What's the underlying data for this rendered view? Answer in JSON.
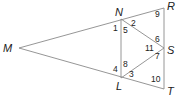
{
  "figure": {
    "colors": {
      "line": "#8a8a8a",
      "text": "#222222",
      "background": "#ffffff"
    },
    "vertices": [
      {
        "name": "M",
        "label": "M",
        "x": 19,
        "y": 48,
        "lx": 3,
        "ly": 52
      },
      {
        "name": "N",
        "label": "N",
        "x": 121,
        "y": 19,
        "lx": 115,
        "ly": 16
      },
      {
        "name": "R",
        "label": "R",
        "x": 164,
        "y": 8,
        "lx": 167,
        "ly": 10
      },
      {
        "name": "S",
        "label": "S",
        "x": 164,
        "y": 48,
        "lx": 167,
        "ly": 54
      },
      {
        "name": "L",
        "label": "L",
        "x": 121,
        "y": 78,
        "lx": 116,
        "ly": 90
      },
      {
        "name": "T",
        "label": "T",
        "x": 164,
        "y": 89,
        "lx": 167,
        "ly": 95
      }
    ],
    "segments": [
      [
        "M",
        "R"
      ],
      [
        "M",
        "T"
      ],
      [
        "R",
        "T"
      ],
      [
        "N",
        "L"
      ],
      [
        "N",
        "S"
      ],
      [
        "L",
        "S"
      ]
    ],
    "angles": [
      {
        "label": "1",
        "x": 113,
        "y": 31
      },
      {
        "label": "2",
        "x": 131,
        "y": 26
      },
      {
        "label": "5",
        "x": 123,
        "y": 33
      },
      {
        "label": "9",
        "x": 155,
        "y": 17
      },
      {
        "label": "6",
        "x": 155,
        "y": 42
      },
      {
        "label": "11",
        "x": 145,
        "y": 51
      },
      {
        "label": "7",
        "x": 155,
        "y": 59
      },
      {
        "label": "8",
        "x": 123,
        "y": 67
      },
      {
        "label": "4",
        "x": 113,
        "y": 72
      },
      {
        "label": "3",
        "x": 129,
        "y": 77
      },
      {
        "label": "10",
        "x": 151,
        "y": 82
      }
    ]
  }
}
